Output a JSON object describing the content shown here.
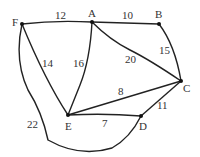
{
  "graph": {
    "nodes": [
      {
        "id": "F",
        "x": 22,
        "y": 24,
        "lx": 12,
        "ly": 17
      },
      {
        "id": "A",
        "x": 92,
        "y": 22,
        "lx": 88,
        "ly": 8
      },
      {
        "id": "B",
        "x": 159,
        "y": 24,
        "lx": 155,
        "ly": 9
      },
      {
        "id": "C",
        "x": 181,
        "y": 81,
        "lx": 183,
        "ly": 83
      },
      {
        "id": "D",
        "x": 141,
        "y": 116,
        "lx": 139,
        "ly": 121
      },
      {
        "id": "E",
        "x": 68,
        "y": 115,
        "lx": 65,
        "ly": 121
      }
    ],
    "edges": [
      {
        "from": "F",
        "to": "A",
        "weight": "12",
        "lx": 55,
        "ly": 10
      },
      {
        "from": "A",
        "to": "B",
        "weight": "10",
        "lx": 122,
        "ly": 10
      },
      {
        "from": "B",
        "to": "C",
        "weight": "15",
        "lx": 159,
        "ly": 45
      },
      {
        "from": "A",
        "to": "C",
        "weight": "20",
        "lx": 125,
        "ly": 54
      },
      {
        "from": "F",
        "to": "E",
        "weight": "14",
        "lx": 42,
        "ly": 58
      },
      {
        "from": "A",
        "to": "E",
        "weight": "16",
        "lx": 73,
        "ly": 58
      },
      {
        "from": "E",
        "to": "C",
        "weight": "8",
        "lx": 118,
        "ly": 86
      },
      {
        "from": "E",
        "to": "D",
        "weight": "7",
        "lx": 102,
        "ly": 118
      },
      {
        "from": "D",
        "to": "C",
        "weight": "11",
        "lx": 157,
        "ly": 100
      },
      {
        "from": "F",
        "to": "D",
        "weight": "22",
        "lx": 27,
        "ly": 119
      }
    ]
  }
}
